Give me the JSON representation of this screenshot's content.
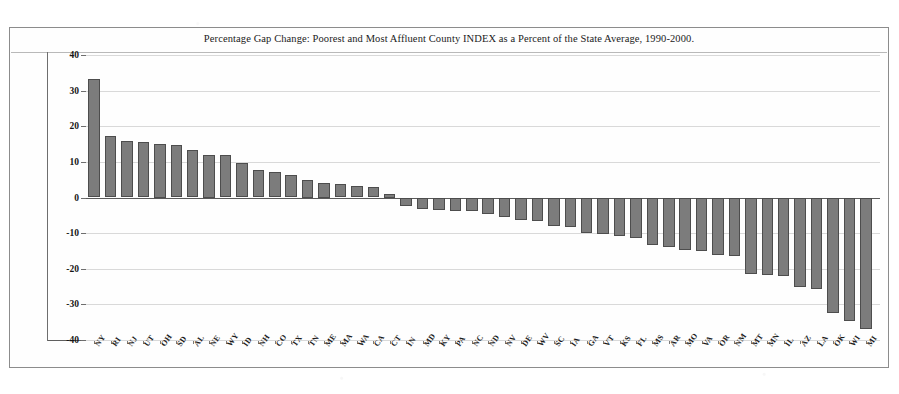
{
  "chart_data": {
    "type": "bar",
    "title": "Percentage Gap Change: Poorest and Most Affluent County INDEX as a Percent of the State Average, 1990-2000.",
    "xlabel": "",
    "ylabel": "",
    "ylim": [
      -40,
      40
    ],
    "yticks": [
      40,
      30,
      20,
      10,
      0,
      -10,
      -20,
      -30,
      -40
    ],
    "ytick_labels": [
      "40",
      "30",
      "20",
      "10",
      "0",
      "-10",
      "-20",
      "-30",
      "-40"
    ],
    "grid": true,
    "legend": "none",
    "bar_color": "#7c7c7c",
    "bar_edge_color": "#4d4d4d",
    "categories": [
      "NY",
      "RI",
      "NJ",
      "UT",
      "OH",
      "SD",
      "AL",
      "NE",
      "WY",
      "ID",
      "NH",
      "CO",
      "TX",
      "TN",
      "ME",
      "MA",
      "WA",
      "CA",
      "CT",
      "IN",
      "MD",
      "KY",
      "PA",
      "NC",
      "ND",
      "NV",
      "DE",
      "WV",
      "SC",
      "IA",
      "GA",
      "VT",
      "KS",
      "FL",
      "MS",
      "AR",
      "MO",
      "VA",
      "OR",
      "NM",
      "MT",
      "MN",
      "IL",
      "AZ",
      "LA",
      "OK",
      "WI",
      "MI"
    ],
    "values": [
      33.2,
      17.4,
      15.8,
      15.6,
      15.0,
      14.6,
      13.3,
      12.0,
      11.9,
      9.6,
      7.8,
      7.2,
      6.3,
      5.0,
      4.0,
      3.8,
      3.3,
      2.9,
      1.0,
      -2.4,
      -3.2,
      -3.4,
      -3.7,
      -3.9,
      -4.6,
      -5.6,
      -6.3,
      -6.6,
      -8.0,
      -8.3,
      -9.9,
      -10.2,
      -10.8,
      -11.4,
      -13.2,
      -14.0,
      -14.6,
      -14.9,
      -16.0,
      -16.3,
      -21.5,
      -21.8,
      -22.0,
      -25.1,
      -25.6,
      -32.5,
      -34.6,
      -36.8
    ],
    "units": "percent"
  },
  "figure": {
    "frame_label": "chart-border"
  }
}
